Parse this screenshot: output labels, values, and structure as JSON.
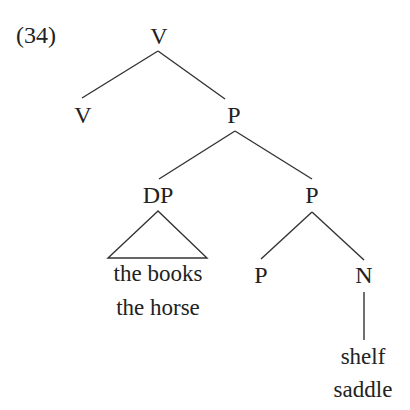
{
  "example": {
    "number": "(34)"
  },
  "tree": {
    "root": {
      "label": "V"
    },
    "root_left": {
      "label": "V"
    },
    "root_right": {
      "label": "P"
    },
    "dp": {
      "label": "DP",
      "terminal_lines": [
        "the books",
        "the horse"
      ]
    },
    "p_bar": {
      "label": "P"
    },
    "p_head": {
      "label": "P"
    },
    "n": {
      "label": "N",
      "terminal_lines": [
        "shelf",
        "saddle"
      ]
    }
  },
  "colors": {
    "ink": "#222222",
    "lines": "#333333",
    "background": "#ffffff"
  }
}
